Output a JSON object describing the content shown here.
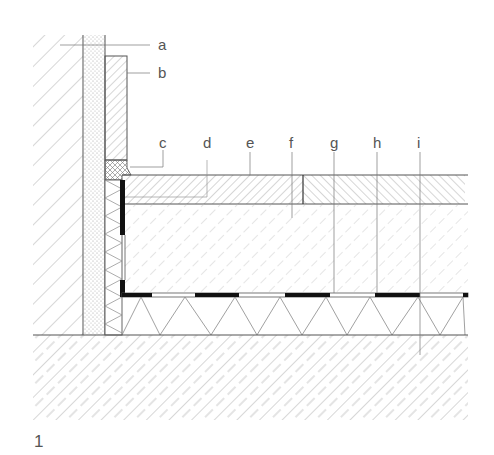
{
  "figure": {
    "number": "1",
    "type": "construction section detail: wall-to-floor junction"
  },
  "labels": [
    {
      "id": "a",
      "text": "a",
      "x": 158,
      "y": 50,
      "leader_to_x": 60,
      "leader_y": 45
    },
    {
      "id": "b",
      "text": "b",
      "x": 158,
      "y": 78,
      "leader_to_x": 127,
      "leader_y": 73
    },
    {
      "id": "c",
      "text": "c",
      "x": 163,
      "y": 148
    },
    {
      "id": "d",
      "text": "d",
      "x": 207,
      "y": 148
    },
    {
      "id": "e",
      "text": "e",
      "x": 250,
      "y": 148
    },
    {
      "id": "f",
      "text": "f",
      "x": 292,
      "y": 148
    },
    {
      "id": "g",
      "text": "g",
      "x": 334,
      "y": 148
    },
    {
      "id": "h",
      "text": "h",
      "x": 377,
      "y": 148
    },
    {
      "id": "i",
      "text": "i",
      "x": 420,
      "y": 148
    }
  ],
  "colors": {
    "line": "#555555",
    "hatch": "#9a9a9a",
    "membrane": "#111111",
    "text": "#555555"
  }
}
